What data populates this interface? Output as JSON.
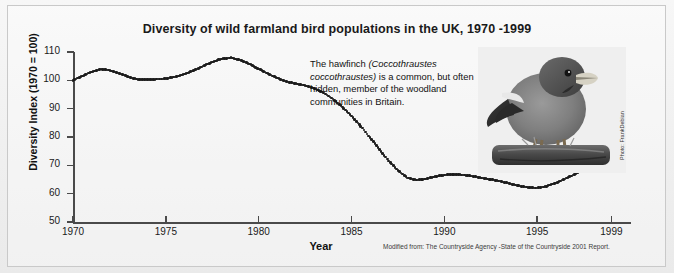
{
  "figure": {
    "title": "Diversity of wild farmland bird populations in the UK, 1970 -1999",
    "source_note": "Modified from: The Countryside Agency -State of the Countryside 2001 Report.",
    "photo_credit": "Photo: FrankDebian",
    "photo_alt": "hawfinch-perched-on-branch"
  },
  "caption": {
    "part1": "The hawfinch ",
    "species_italic": "(Coccothraustes coccothraustes)",
    "part2": " is a common, but often hidden, member of the woodland communities in Britain."
  },
  "chart_data": {
    "type": "line",
    "title": "Diversity of wild farmland bird populations in the UK, 1970 -1999",
    "xlabel": "Year",
    "ylabel": "Diversity Index (1970 = 100)",
    "xlim": [
      1970,
      2000
    ],
    "ylim": [
      50,
      110
    ],
    "xticks": [
      1970,
      1975,
      1980,
      1985,
      1990,
      1995,
      1999
    ],
    "yticks": [
      50,
      60,
      70,
      80,
      90,
      100,
      110
    ],
    "grid": false,
    "legend": "none",
    "marker": "dotted",
    "series": [
      {
        "name": "Diversity Index (1970 = 100)",
        "x": [
          1970,
          1970.5,
          1971,
          1971.5,
          1972,
          1972.5,
          1973,
          1973.5,
          1974,
          1974.5,
          1975,
          1975.5,
          1976,
          1976.5,
          1977,
          1977.5,
          1978,
          1978.5,
          1979,
          1979.5,
          1980,
          1980.5,
          1981,
          1981.5,
          1982,
          1982.5,
          1983,
          1983.5,
          1984,
          1984.5,
          1985,
          1985.5,
          1986,
          1986.5,
          1987,
          1987.5,
          1988,
          1988.5,
          1989,
          1989.5,
          1990,
          1990.5,
          1991,
          1991.5,
          1992,
          1992.5,
          1993,
          1993.5,
          1994,
          1994.5,
          1995,
          1995.5,
          1996,
          1996.5,
          1997,
          1997.5,
          1998,
          1998.5,
          1999
        ],
        "values": [
          100.0,
          101.5,
          103.0,
          104.0,
          103.5,
          102.5,
          101.2,
          100.3,
          100.2,
          100.4,
          100.6,
          101.2,
          102.2,
          103.5,
          105.0,
          106.5,
          107.6,
          108.0,
          107.2,
          105.8,
          104.0,
          102.4,
          100.8,
          99.6,
          98.8,
          98.2,
          97.2,
          95.6,
          93.4,
          90.6,
          87.4,
          83.8,
          79.8,
          75.6,
          71.6,
          68.2,
          65.6,
          64.8,
          65.2,
          66.0,
          66.6,
          66.8,
          66.6,
          66.2,
          65.6,
          65.0,
          64.4,
          63.6,
          62.8,
          62.2,
          62.0,
          62.6,
          63.8,
          65.2,
          66.8,
          68.4,
          70.0,
          71.2,
          72.0
        ]
      }
    ]
  }
}
